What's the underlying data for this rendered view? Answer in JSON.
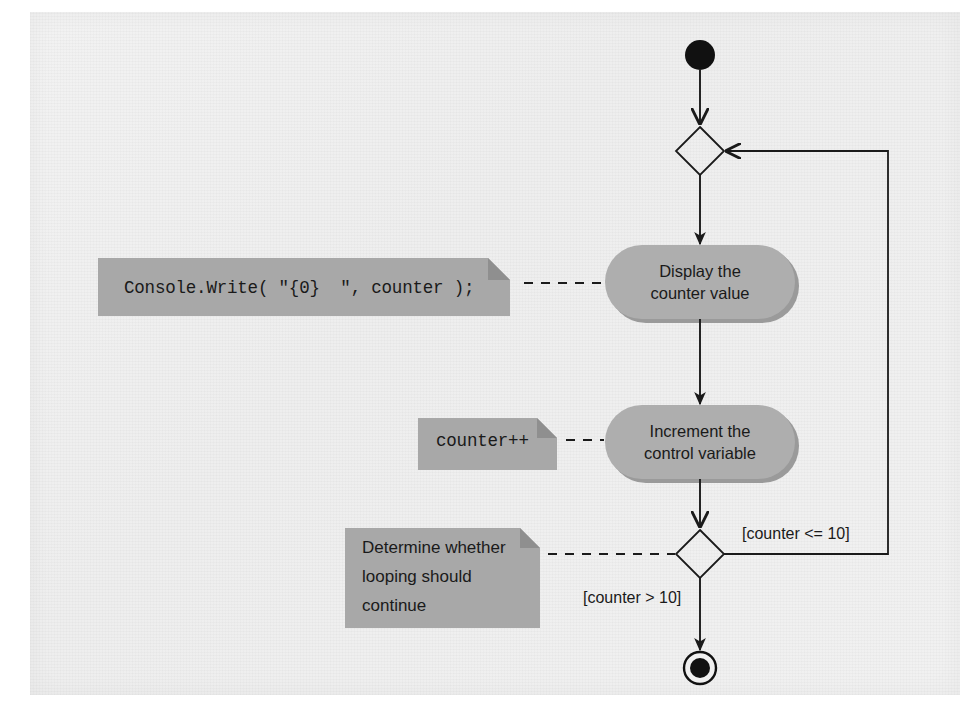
{
  "diagram": {
    "type": "uml-activity-diagram",
    "background_color": "#f0f0f0",
    "node_fill_color": "#a9a9a9",
    "note_fill_color": "#a8a8a8",
    "line_color": "#1a1a1a",
    "nodes": {
      "initial": {
        "name": "initial-state",
        "shape": "filled-circle"
      },
      "merge": {
        "name": "merge-node",
        "shape": "diamond"
      },
      "display": {
        "name": "display-activity",
        "shape": "rounded-rectangle",
        "line1": "Display the",
        "line2": "counter value"
      },
      "increment": {
        "name": "increment-activity",
        "shape": "rounded-rectangle",
        "line1": "Increment the",
        "line2": "control variable"
      },
      "decision": {
        "name": "decision-node",
        "shape": "diamond"
      },
      "final": {
        "name": "final-state",
        "shape": "bullseye-circle"
      }
    },
    "notes": {
      "display_note": {
        "text": "Console.Write( \"{0}  \", counter );",
        "style": "code"
      },
      "increment_note": {
        "text": "counter++",
        "style": "code"
      },
      "decision_note": {
        "line1": "Determine whether",
        "line2": "looping should",
        "line3": "continue",
        "style": "prose"
      }
    },
    "guards": {
      "loop_continue": "[counter <= 10]",
      "loop_exit": "[counter > 10]"
    }
  }
}
